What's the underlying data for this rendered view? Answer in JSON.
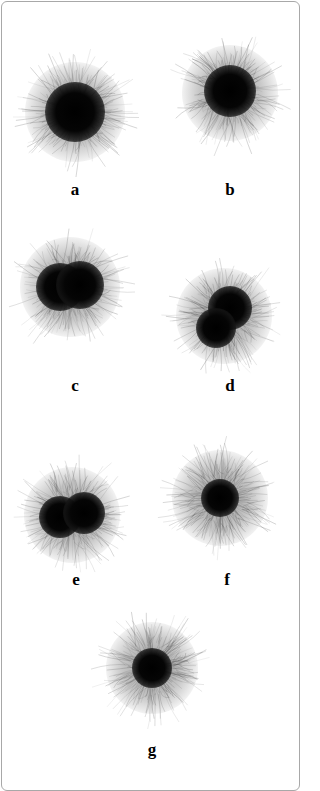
{
  "figure": {
    "panels": [
      {
        "id": "a",
        "label": "a",
        "cx": 75,
        "cy": 112,
        "halo_r": 50,
        "cores": [
          {
            "dx": 0,
            "dy": 0,
            "r": 30
          }
        ]
      },
      {
        "id": "b",
        "label": "b",
        "cx": 230,
        "cy": 93,
        "halo_r": 48,
        "cores": [
          {
            "dx": 0,
            "dy": -2,
            "r": 26
          }
        ]
      },
      {
        "id": "c",
        "label": "c",
        "cx": 70,
        "cy": 287,
        "halo_r": 50,
        "cores": [
          {
            "dx": -10,
            "dy": 0,
            "r": 24
          },
          {
            "dx": 10,
            "dy": -2,
            "r": 24
          }
        ]
      },
      {
        "id": "d",
        "label": "d",
        "cx": 224,
        "cy": 316,
        "halo_r": 48,
        "cores": [
          {
            "dx": 6,
            "dy": -8,
            "r": 22
          },
          {
            "dx": -8,
            "dy": 12,
            "r": 20
          }
        ]
      },
      {
        "id": "e",
        "label": "e",
        "cx": 72,
        "cy": 515,
        "halo_r": 48,
        "cores": [
          {
            "dx": -12,
            "dy": 2,
            "r": 21
          },
          {
            "dx": 12,
            "dy": -2,
            "r": 21
          }
        ]
      },
      {
        "id": "f",
        "label": "f",
        "cx": 220,
        "cy": 498,
        "halo_r": 48,
        "cores": [
          {
            "dx": 0,
            "dy": 0,
            "r": 19
          }
        ]
      },
      {
        "id": "g",
        "label": "g",
        "cx": 152,
        "cy": 668,
        "halo_r": 46,
        "cores": [
          {
            "dx": 0,
            "dy": 0,
            "r": 20
          }
        ]
      }
    ],
    "labels": [
      {
        "text": "a",
        "x": 75,
        "y": 189
      },
      {
        "text": "b",
        "x": 230,
        "y": 189
      },
      {
        "text": "c",
        "x": 75,
        "y": 385
      },
      {
        "text": "d",
        "x": 230,
        "y": 385
      },
      {
        "text": "e",
        "x": 76,
        "y": 579
      },
      {
        "text": "f",
        "x": 227,
        "y": 579
      },
      {
        "text": "g",
        "x": 152,
        "y": 749
      }
    ]
  }
}
